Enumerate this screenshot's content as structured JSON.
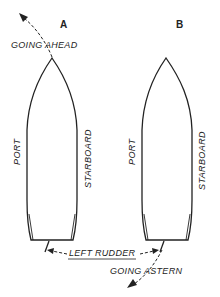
{
  "diagram": {
    "ships": [
      {
        "id": "A",
        "label": "A",
        "port_label": "PORT",
        "starboard_label": "STARBOARD",
        "motion": "GOING AHEAD"
      },
      {
        "id": "B",
        "label": "B",
        "port_label": "PORT",
        "starboard_label": "STARBOARD",
        "motion": "GOING ASTERN"
      }
    ],
    "rudder_label": "LEFT RUDDER",
    "going_ahead_label": "GOING  AHEAD",
    "going_astern_label": "GOING  ASTERN",
    "colors": {
      "line": "#222222",
      "background": "#ffffff"
    }
  }
}
